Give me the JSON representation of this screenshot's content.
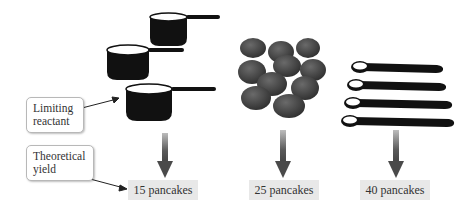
{
  "diagram": {
    "columns": [
      {
        "ingredient": "measuring-cups",
        "count": 3,
        "result": "15 pancakes"
      },
      {
        "ingredient": "eggs",
        "count": 12,
        "result": "25 pancakes"
      },
      {
        "ingredient": "measuring-spoons",
        "count": 4,
        "result": "40 pancakes"
      }
    ],
    "callouts": {
      "limiting_reactant": {
        "line1": "Limiting",
        "line2": "reactant"
      },
      "theoretical_yield": {
        "line1": "Theoretical",
        "line2": "yield"
      }
    },
    "colors": {
      "ink": "#111111",
      "egg": "#4a4a4a",
      "arrow": "#555555",
      "label_bg": "#e8e8e8"
    }
  }
}
